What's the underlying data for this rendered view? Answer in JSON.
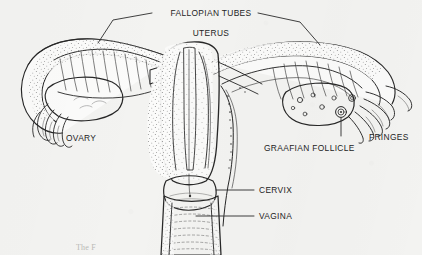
{
  "figure": {
    "style": "pen-and-ink stipple engraving, scanned book page",
    "background_color": "#f3f3f1",
    "ink_color": "#272727"
  },
  "labels": {
    "fallopian_tubes": "FALLOPIAN TUBES",
    "uterus": "UTERUS",
    "ovary": "OVARY",
    "graafian_follicle": "GRAAFIAN FOLLICLE",
    "fringes": "FRINGES",
    "cervix": "CERVIX",
    "vagina": "VAGINA"
  },
  "caption": {
    "text": "The F"
  },
  "parts": [
    {
      "id": "fallopian-tubes",
      "label": "FALLOPIAN TUBES",
      "side": "both",
      "leaders": 2
    },
    {
      "id": "uterus",
      "label": "UTERUS",
      "side": "center",
      "leaders": 0
    },
    {
      "id": "ovary",
      "label": "OVARY",
      "side": "left",
      "leaders": 0
    },
    {
      "id": "graafian-follicle",
      "label": "GRAAFIAN FOLLICLE",
      "side": "right",
      "leaders": 1
    },
    {
      "id": "fringes",
      "label": "FRINGES",
      "side": "right",
      "leaders": 0
    },
    {
      "id": "cervix",
      "label": "CERVIX",
      "side": "center",
      "leaders": 1
    },
    {
      "id": "vagina",
      "label": "VAGINA",
      "side": "center",
      "leaders": 1
    }
  ]
}
